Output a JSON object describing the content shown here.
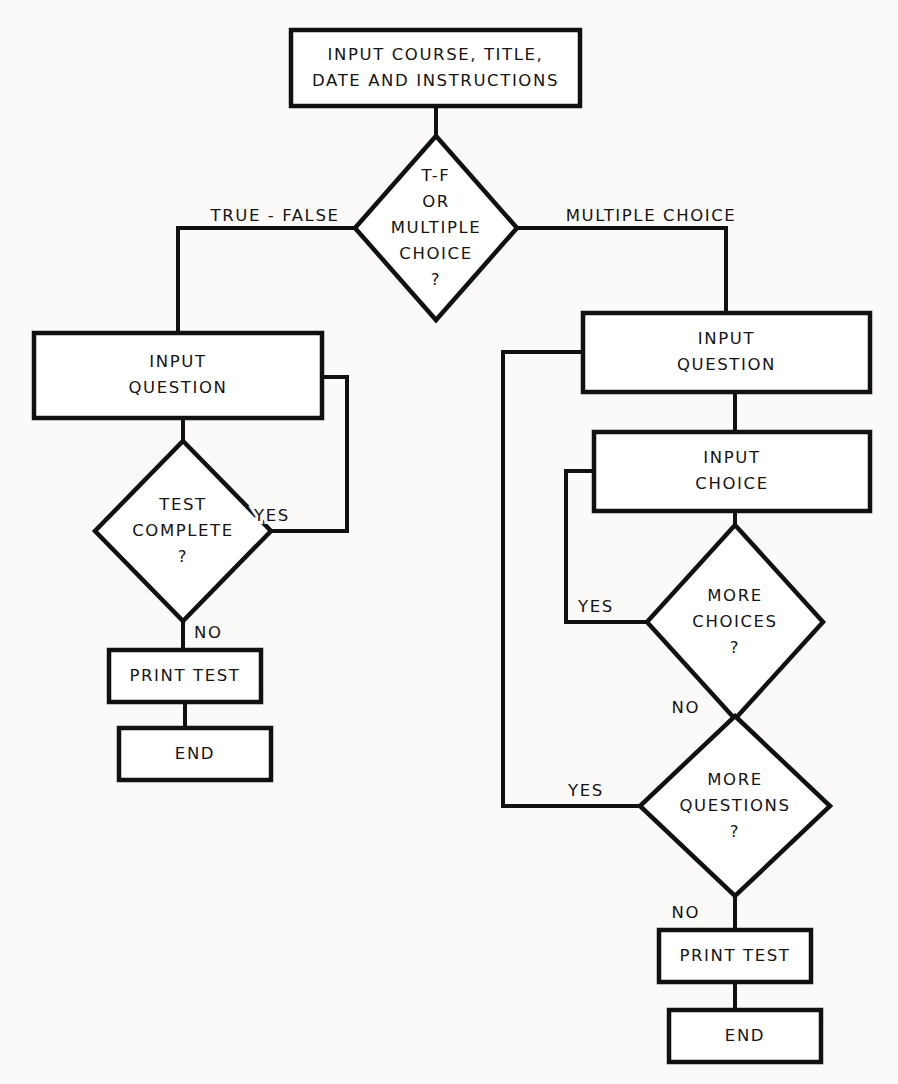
{
  "diagram": {
    "type": "flowchart",
    "canvas": {
      "width": 898,
      "height": 1084
    },
    "colors": {
      "stroke": "#111111",
      "fill": "#ffffff",
      "text": "#141414",
      "background": "#fbfaf8"
    },
    "nodes": [
      {
        "id": "start-input",
        "shape": "process",
        "lines": [
          "INPUT COURSE, TITLE,",
          "DATE AND INSTRUCTIONS"
        ],
        "x": 291,
        "y": 30,
        "w": 289,
        "h": 76
      },
      {
        "id": "type-decision",
        "shape": "decision",
        "lines": [
          "T-F",
          "OR",
          "MULTIPLE",
          "CHOICE",
          "?"
        ],
        "cx": 436,
        "cy": 228,
        "rx": 81,
        "ry": 92
      },
      {
        "id": "tf-input-question",
        "shape": "process",
        "lines": [
          "INPUT",
          "QUESTION"
        ],
        "x": 34,
        "y": 333,
        "w": 288,
        "h": 85
      },
      {
        "id": "tf-test-complete",
        "shape": "decision",
        "lines": [
          "TEST",
          "COMPLETE",
          "?"
        ],
        "cx": 183,
        "cy": 531,
        "rx": 88,
        "ry": 90
      },
      {
        "id": "tf-print-test",
        "shape": "process",
        "lines": [
          "PRINT TEST"
        ],
        "x": 109,
        "y": 650,
        "w": 152,
        "h": 52
      },
      {
        "id": "tf-end",
        "shape": "process",
        "lines": [
          "END"
        ],
        "x": 119,
        "y": 728,
        "w": 152,
        "h": 52
      },
      {
        "id": "mc-input-question",
        "shape": "process",
        "lines": [
          "INPUT",
          "QUESTION"
        ],
        "x": 583,
        "y": 313,
        "w": 287,
        "h": 79
      },
      {
        "id": "mc-input-choice",
        "shape": "process",
        "lines": [
          "INPUT",
          "CHOICE"
        ],
        "x": 594,
        "y": 432,
        "w": 276,
        "h": 79
      },
      {
        "id": "mc-more-choices",
        "shape": "decision",
        "lines": [
          "MORE",
          "CHOICES",
          "?"
        ],
        "cx": 735,
        "cy": 622,
        "rx": 88,
        "ry": 97
      },
      {
        "id": "mc-more-questions",
        "shape": "decision",
        "lines": [
          "MORE",
          "QUESTIONS",
          "?"
        ],
        "cx": 735,
        "cy": 806,
        "rx": 95,
        "ry": 90
      },
      {
        "id": "mc-print-test",
        "shape": "process",
        "lines": [
          "PRINT TEST"
        ],
        "x": 659,
        "y": 930,
        "w": 152,
        "h": 52
      },
      {
        "id": "mc-end",
        "shape": "process",
        "lines": [
          "END"
        ],
        "x": 669,
        "y": 1010,
        "w": 152,
        "h": 52
      }
    ],
    "edges": [
      {
        "id": "e-start-to-decision",
        "from": "start-input",
        "to": "type-decision",
        "label": "",
        "path": "M 436 106 L 436 136"
      },
      {
        "id": "e-decision-true-false",
        "from": "type-decision",
        "to": "tf-input-question",
        "label": "TRUE - FALSE",
        "label_x": 275,
        "label_y": 216,
        "label_anchor": "mid",
        "path": "M 355 228 L 178 228 L 178 333"
      },
      {
        "id": "e-decision-multiple-choice",
        "from": "type-decision",
        "to": "mc-input-question",
        "label": "MULTIPLE CHOICE",
        "label_x": 651,
        "label_y": 216,
        "label_anchor": "mid",
        "path": "M 517 228 L 726 228 L 726 313"
      },
      {
        "id": "e-tf-question-to-complete",
        "from": "tf-input-question",
        "to": "tf-test-complete",
        "label": "",
        "path": "M 183 418 L 183 441"
      },
      {
        "id": "e-tf-yes-loop",
        "from": "tf-test-complete",
        "to": "tf-input-question",
        "label": "YES",
        "label_x": 254,
        "label_y": 516,
        "label_anchor": "start",
        "path": "M 271 531 L 347 531 L 347 377 L 322 377"
      },
      {
        "id": "e-tf-no",
        "from": "tf-test-complete",
        "to": "tf-print-test",
        "label": "NO",
        "label_x": 194,
        "label_y": 633,
        "label_anchor": "start",
        "path": "M 183 621 L 183 650"
      },
      {
        "id": "e-tf-print-to-end",
        "from": "tf-print-test",
        "to": "tf-end",
        "label": "",
        "path": "M 185 702 L 185 728"
      },
      {
        "id": "e-mc-question-to-choice",
        "from": "mc-input-question",
        "to": "mc-input-choice",
        "label": "",
        "path": "M 735 392 L 735 432"
      },
      {
        "id": "e-mc-choice-to-more-choices",
        "from": "mc-input-choice",
        "to": "mc-more-choices",
        "label": "",
        "path": "M 735 511 L 735 525"
      },
      {
        "id": "e-mc-choices-yes-loop",
        "from": "mc-more-choices",
        "to": "mc-input-choice",
        "label": "YES",
        "label_x": 578,
        "label_y": 607,
        "label_anchor": "start",
        "path": "M 647 622 L 566 622 L 566 471 L 594 471"
      },
      {
        "id": "e-mc-choices-no",
        "from": "mc-more-choices",
        "to": "mc-more-questions",
        "label": "NO",
        "label_x": 700,
        "label_y": 708,
        "label_anchor": "end",
        "path": "M 735 719 L 735 717"
      },
      {
        "id": "e-mc-questions-yes-loop",
        "from": "mc-more-questions",
        "to": "mc-input-question",
        "label": "YES",
        "label_x": 568,
        "label_y": 791,
        "label_anchor": "start",
        "path": "M 640 806 L 503 806 L 503 352 L 583 352"
      },
      {
        "id": "e-mc-questions-no",
        "from": "mc-more-questions",
        "to": "mc-print-test",
        "label": "NO",
        "label_x": 700,
        "label_y": 913,
        "label_anchor": "end",
        "path": "M 735 896 L 735 930"
      },
      {
        "id": "e-mc-print-to-end",
        "from": "mc-print-test",
        "to": "mc-end",
        "label": "",
        "path": "M 735 982 L 735 1010"
      }
    ]
  }
}
